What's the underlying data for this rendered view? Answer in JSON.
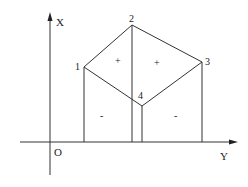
{
  "diagram": {
    "axes": {
      "vertical_label": "X",
      "horizontal_label": "Y",
      "origin_label": "O"
    },
    "points": [
      {
        "label": "1",
        "x": 84,
        "y": 67
      },
      {
        "label": "2",
        "x": 132,
        "y": 25
      },
      {
        "label": "3",
        "x": 202,
        "y": 62
      },
      {
        "label": "4",
        "x": 142,
        "y": 106
      }
    ],
    "signs": [
      {
        "label": "+",
        "region": "left-upper"
      },
      {
        "label": "+",
        "region": "right-upper"
      },
      {
        "label": "-",
        "region": "left-lower"
      },
      {
        "label": "-",
        "region": "right-lower"
      }
    ],
    "colors": {
      "line": "#333333",
      "background": "#ffffff"
    }
  }
}
